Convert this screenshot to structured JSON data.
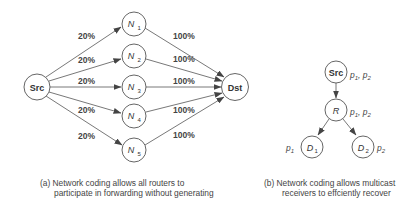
{
  "diagram_a": {
    "source": {
      "label": "Src"
    },
    "destination": {
      "label": "Dst"
    },
    "routers": [
      {
        "label": "N",
        "sub": "1",
        "in_pct": "20%",
        "out_pct": "100%"
      },
      {
        "label": "N",
        "sub": "2",
        "in_pct": "20%",
        "out_pct": "100%"
      },
      {
        "label": "N",
        "sub": "3",
        "in_pct": "20%",
        "out_pct": "100%"
      },
      {
        "label": "N",
        "sub": "4",
        "in_pct": "20%",
        "out_pct": "100%"
      },
      {
        "label": "N",
        "sub": "5",
        "in_pct": "20%",
        "out_pct": "100%"
      }
    ],
    "caption_line1": "(a) Network coding allows all routers to",
    "caption_line2": "participate in forwarding without generating"
  },
  "diagram_b": {
    "source": {
      "label": "Src",
      "packets": [
        "p",
        "1",
        ", p",
        "2"
      ]
    },
    "router": {
      "label": "R",
      "packets": [
        "p",
        "1",
        ", p",
        "2"
      ]
    },
    "receivers": [
      {
        "label": "D",
        "sub": "1",
        "packet": "p",
        "packet_sub": "1"
      },
      {
        "label": "D",
        "sub": "2",
        "packet": "p",
        "packet_sub": "2"
      }
    ],
    "caption_line1": "(b) Network coding allows multicast",
    "caption_line2": "receivers to effciently recover"
  },
  "colors": {
    "stroke": "#555555",
    "text": "#333333",
    "background": "#ffffff"
  }
}
